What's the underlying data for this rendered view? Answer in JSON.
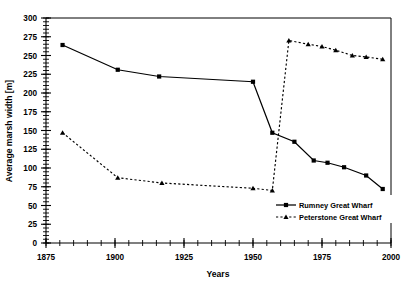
{
  "chart_data": {
    "type": "line",
    "title": "",
    "xlabel": "Years",
    "ylabel": "Average marsh width [m]",
    "xlim": [
      1875,
      2000
    ],
    "ylim": [
      0,
      300
    ],
    "x_major_ticks": [
      1875,
      1900,
      1925,
      1950,
      1975,
      2000
    ],
    "x_tick_labels": [
      "1875",
      "1900",
      "1925",
      "1950",
      "1975",
      "2000"
    ],
    "x_minor_step": 5,
    "y_major_ticks": [
      0,
      25,
      50,
      75,
      100,
      125,
      150,
      175,
      200,
      225,
      250,
      275,
      300
    ],
    "y_tick_labels": [
      "0",
      "25",
      "50",
      "75",
      "100",
      "125",
      "150",
      "175",
      "200",
      "225",
      "250",
      "275",
      "300"
    ],
    "y_minor_step": 5,
    "grid": false,
    "legend_position": "bottom-right",
    "series": [
      {
        "name": "Rumney Great Wharf",
        "linestyle": "solid",
        "marker": "square",
        "color": "#000000",
        "points": [
          {
            "x": 1881,
            "y": 264
          },
          {
            "x": 1901,
            "y": 231
          },
          {
            "x": 1916,
            "y": 222
          },
          {
            "x": 1950,
            "y": 215
          },
          {
            "x": 1957,
            "y": 147
          },
          {
            "x": 1965,
            "y": 135
          },
          {
            "x": 1972,
            "y": 110
          },
          {
            "x": 1977,
            "y": 107
          },
          {
            "x": 1983,
            "y": 101
          },
          {
            "x": 1991,
            "y": 90
          },
          {
            "x": 1997,
            "y": 72
          }
        ]
      },
      {
        "name": "Peterstone Great Wharf",
        "linestyle": "dashed",
        "marker": "triangle",
        "color": "#000000",
        "points": [
          {
            "x": 1881,
            "y": 147
          },
          {
            "x": 1901,
            "y": 87
          },
          {
            "x": 1917,
            "y": 80
          },
          {
            "x": 1950,
            "y": 73
          },
          {
            "x": 1957,
            "y": 70
          },
          {
            "x": 1963,
            "y": 270
          },
          {
            "x": 1970,
            "y": 265
          },
          {
            "x": 1975,
            "y": 262
          },
          {
            "x": 1980,
            "y": 257
          },
          {
            "x": 1986,
            "y": 250
          },
          {
            "x": 1991,
            "y": 248
          },
          {
            "x": 1997,
            "y": 245
          }
        ]
      }
    ],
    "legend_entries": [
      {
        "label": "Rumney Great Wharf",
        "linestyle": "solid",
        "marker": "square"
      },
      {
        "label": "Peterstone Great Wharf",
        "linestyle": "dashed",
        "marker": "triangle"
      }
    ]
  }
}
